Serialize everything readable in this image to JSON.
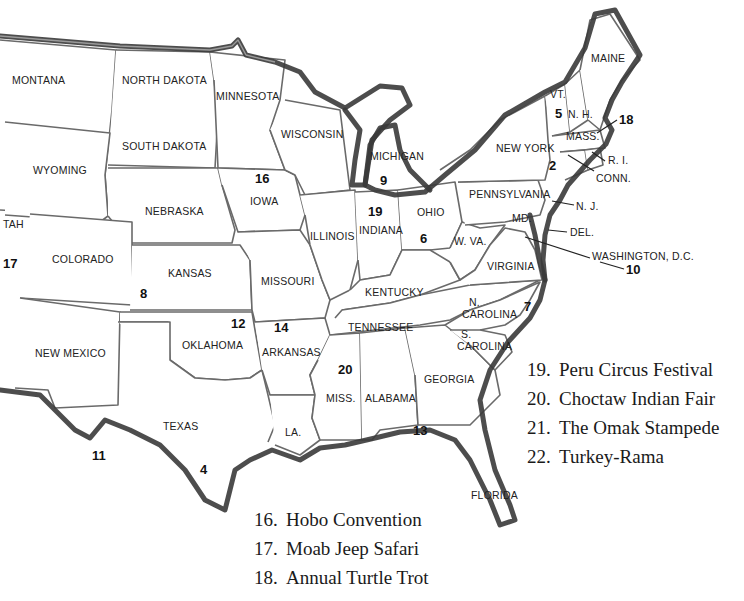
{
  "map": {
    "states": [
      {
        "id": "montana",
        "label": "MONTANA",
        "x": 12,
        "y": 84
      },
      {
        "id": "north-dakota",
        "label": "NORTH DAKOTA",
        "x": 122,
        "y": 84
      },
      {
        "id": "minnesota",
        "label": "MINNESOTA",
        "x": 216,
        "y": 100
      },
      {
        "id": "wisconsin",
        "label": "WISCONSIN",
        "x": 281,
        "y": 138
      },
      {
        "id": "michigan",
        "label": "MICHIGAN",
        "x": 370,
        "y": 160
      },
      {
        "id": "wyoming",
        "label": "WYOMING",
        "x": 33,
        "y": 174
      },
      {
        "id": "south-dakota",
        "label": "SOUTH DAKOTA",
        "x": 122,
        "y": 150
      },
      {
        "id": "nebraska",
        "label": "NEBRASKA",
        "x": 145,
        "y": 215
      },
      {
        "id": "iowa",
        "label": "IOWA",
        "x": 250,
        "y": 205
      },
      {
        "id": "utah",
        "label": "TAH",
        "x": 3,
        "y": 228
      },
      {
        "id": "colorado",
        "label": "COLORADO",
        "x": 52,
        "y": 263
      },
      {
        "id": "kansas",
        "label": "KANSAS",
        "x": 168,
        "y": 277
      },
      {
        "id": "illinois",
        "label": "ILLINOIS",
        "x": 310,
        "y": 240
      },
      {
        "id": "indiana",
        "label": "INDIANA",
        "x": 359,
        "y": 234
      },
      {
        "id": "ohio",
        "label": "OHIO",
        "x": 417,
        "y": 216
      },
      {
        "id": "missouri",
        "label": "MISSOURI",
        "x": 261,
        "y": 285
      },
      {
        "id": "kentucky",
        "label": "KENTUCKY",
        "x": 365,
        "y": 296
      },
      {
        "id": "west-virginia",
        "label": "W. VA.",
        "x": 454,
        "y": 245
      },
      {
        "id": "virginia",
        "label": "VIRGINIA",
        "x": 487,
        "y": 270
      },
      {
        "id": "new-york",
        "label": "NEW YORK",
        "x": 496,
        "y": 152
      },
      {
        "id": "pennsylvania",
        "label": "PENNSYLVANIA",
        "x": 469,
        "y": 198
      },
      {
        "id": "maine",
        "label": "MAINE",
        "x": 591,
        "y": 62
      },
      {
        "id": "vermont",
        "label": "VT.",
        "x": 550,
        "y": 98
      },
      {
        "id": "new-hampshire",
        "label": "N. H.",
        "x": 568,
        "y": 118
      },
      {
        "id": "massachusetts",
        "label": "MASS.",
        "x": 566,
        "y": 140
      },
      {
        "id": "rhode-island",
        "label": "R. I.",
        "x": 608,
        "y": 164
      },
      {
        "id": "connecticut",
        "label": "CONN.",
        "x": 596,
        "y": 182
      },
      {
        "id": "new-jersey",
        "label": "N. J.",
        "x": 576,
        "y": 210
      },
      {
        "id": "maryland",
        "label": "MD.",
        "x": 512,
        "y": 222
      },
      {
        "id": "delaware",
        "label": "DEL.",
        "x": 570,
        "y": 236
      },
      {
        "id": "washington-dc",
        "label": "WASHINGTON, D.C.",
        "x": 592,
        "y": 260
      },
      {
        "id": "oklahoma",
        "label": "OKLAHOMA",
        "x": 182,
        "y": 349
      },
      {
        "id": "new-mexico",
        "label": "NEW MEXICO",
        "x": 35,
        "y": 357
      },
      {
        "id": "arkansas",
        "label": "ARKANSAS",
        "x": 262,
        "y": 356
      },
      {
        "id": "tennessee",
        "label": "TENNESSEE",
        "x": 348,
        "y": 331
      },
      {
        "id": "north-carolina-1",
        "label": "N.",
        "x": 469,
        "y": 306
      },
      {
        "id": "north-carolina-2",
        "label": "CAROLINA",
        "x": 462,
        "y": 318
      },
      {
        "id": "south-carolina-1",
        "label": "S.",
        "x": 461,
        "y": 338
      },
      {
        "id": "south-carolina-2",
        "label": "CAROLINA",
        "x": 457,
        "y": 350
      },
      {
        "id": "georgia",
        "label": "GEORGIA",
        "x": 424,
        "y": 383
      },
      {
        "id": "mississippi",
        "label": "MISS.",
        "x": 326,
        "y": 402
      },
      {
        "id": "alabama",
        "label": "ALABAMA",
        "x": 365,
        "y": 402
      },
      {
        "id": "texas",
        "label": "TEXAS",
        "x": 163,
        "y": 430
      },
      {
        "id": "louisiana",
        "label": "LA.",
        "x": 285,
        "y": 436
      },
      {
        "id": "florida",
        "label": "FLORIDA",
        "x": 471,
        "y": 499
      }
    ],
    "markers": [
      {
        "number": "2",
        "x": 549,
        "y": 170
      },
      {
        "number": "4",
        "x": 200,
        "y": 474
      },
      {
        "number": "5",
        "x": 555,
        "y": 118
      },
      {
        "number": "6",
        "x": 420,
        "y": 243
      },
      {
        "number": "7",
        "x": 524,
        "y": 311
      },
      {
        "number": "8",
        "x": 140,
        "y": 298
      },
      {
        "number": "9",
        "x": 380,
        "y": 185
      },
      {
        "number": "10",
        "x": 626,
        "y": 274
      },
      {
        "number": "11",
        "x": 92,
        "y": 460
      },
      {
        "number": "12",
        "x": 231,
        "y": 328
      },
      {
        "number": "13",
        "x": 413,
        "y": 435
      },
      {
        "number": "14",
        "x": 274,
        "y": 332
      },
      {
        "number": "16",
        "x": 255,
        "y": 183
      },
      {
        "number": "17",
        "x": 3,
        "y": 268
      },
      {
        "number": "18",
        "x": 619,
        "y": 124
      },
      {
        "number": "19",
        "x": 368,
        "y": 216
      },
      {
        "number": "20",
        "x": 338,
        "y": 374
      }
    ]
  },
  "legend_bottom": [
    {
      "num": "16.",
      "name": "Hobo Convention"
    },
    {
      "num": "17.",
      "name": "Moab Jeep Safari"
    },
    {
      "num": "18.",
      "name": "Annual Turtle Trot"
    }
  ],
  "legend_right": [
    {
      "num": "19.",
      "name": "Peru Circus Festival"
    },
    {
      "num": "20.",
      "name": "Choctaw Indian Fair"
    },
    {
      "num": "21.",
      "name": "The Omak Stampede"
    },
    {
      "num": "22.",
      "name": "Turkey-Rama"
    }
  ]
}
